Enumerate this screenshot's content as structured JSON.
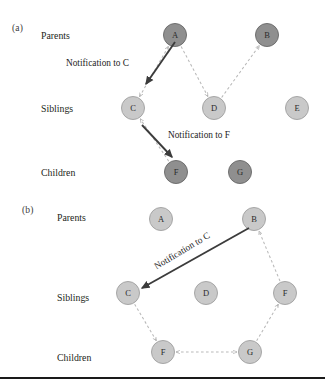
{
  "figure": {
    "background": "#ffffff",
    "rule_color": "#1a1a1a",
    "rule_y": 377
  },
  "colors": {
    "node_dark_fill": "#8f8f8f",
    "node_dark_stroke": "#6f6f6f",
    "node_light_fill": "#c9c9c9",
    "node_light_stroke": "#a6a6a6",
    "dashed_edge": "#b9b9b9",
    "solid_arrow": "#3c3c3c",
    "label_text": "#231f20"
  },
  "panels": [
    {
      "tag": "(a)",
      "tag_pos": {
        "x": 12,
        "y": 23
      },
      "row_labels": [
        {
          "text": "Parents",
          "x": 41,
          "y": 30
        },
        {
          "text": "Siblings",
          "x": 41,
          "y": 103
        },
        {
          "text": "Children",
          "x": 41,
          "y": 167
        }
      ],
      "nodes": [
        {
          "id": "A",
          "label": "A",
          "x": 175,
          "y": 35,
          "shade": "dark"
        },
        {
          "id": "B",
          "label": "B",
          "x": 267,
          "y": 35,
          "shade": "dark"
        },
        {
          "id": "C",
          "label": "C",
          "x": 133,
          "y": 108,
          "shade": "light"
        },
        {
          "id": "D",
          "label": "D",
          "x": 214,
          "y": 108,
          "shade": "light"
        },
        {
          "id": "E",
          "label": "E",
          "x": 297,
          "y": 108,
          "shade": "light"
        },
        {
          "id": "F",
          "label": "F",
          "x": 176,
          "y": 172,
          "shade": "dark"
        },
        {
          "id": "G",
          "label": "G",
          "x": 240,
          "y": 172,
          "shade": "dark"
        }
      ],
      "edges": [
        {
          "from": "C",
          "to": "A",
          "style": "dashed",
          "arrow": "both"
        },
        {
          "from": "A",
          "to": "D",
          "style": "dashed",
          "arrow": "end"
        },
        {
          "from": "D",
          "to": "B",
          "style": "dashed",
          "arrow": "end"
        },
        {
          "from": "F",
          "to": "C",
          "style": "dashed",
          "arrow": "end"
        }
      ],
      "annotations": [
        {
          "text": "Notification to C",
          "text_x": 66,
          "text_y": 58,
          "rotate": 0,
          "arrow": {
            "x1": 175,
            "y1": 42,
            "x2": 146,
            "y2": 84
          }
        },
        {
          "text": "Notification to F",
          "text_x": 168,
          "text_y": 130,
          "rotate": 0,
          "arrow": {
            "x1": 142,
            "y1": 125,
            "x2": 172,
            "y2": 157
          }
        }
      ]
    },
    {
      "tag": "(b)",
      "tag_pos": {
        "x": 22,
        "y": 205
      },
      "row_labels": [
        {
          "text": "Parents",
          "x": 57,
          "y": 212
        },
        {
          "text": "Siblings",
          "x": 57,
          "y": 292
        },
        {
          "text": "Children",
          "x": 57,
          "y": 352
        }
      ],
      "nodes": [
        {
          "id": "A",
          "label": "A",
          "x": 161,
          "y": 219,
          "shade": "light"
        },
        {
          "id": "B",
          "label": "B",
          "x": 254,
          "y": 219,
          "shade": "light"
        },
        {
          "id": "C",
          "label": "C",
          "x": 128,
          "y": 293,
          "shade": "light"
        },
        {
          "id": "D",
          "label": "D",
          "x": 206,
          "y": 293,
          "shade": "light"
        },
        {
          "id": "F",
          "label": "F",
          "x": 285,
          "y": 293,
          "shade": "light"
        },
        {
          "id": "F2",
          "label": "F",
          "x": 163,
          "y": 352,
          "shade": "light"
        },
        {
          "id": "G",
          "label": "G",
          "x": 250,
          "y": 352,
          "shade": "light"
        }
      ],
      "edges": [
        {
          "from": "C",
          "to": "F2",
          "style": "dashed",
          "arrow": "end"
        },
        {
          "from": "F2",
          "to": "G",
          "style": "dashed",
          "arrow": "both"
        },
        {
          "from": "G",
          "to": "F",
          "style": "dashed",
          "arrow": "end"
        },
        {
          "from": "F",
          "to": "B",
          "style": "dashed",
          "arrow": "end"
        }
      ],
      "annotations": [
        {
          "text": "Notification to C",
          "text_x": 155,
          "text_y": 262,
          "rotate": -31,
          "arrow": {
            "x1": 249,
            "y1": 228,
            "x2": 142,
            "y2": 288
          }
        }
      ]
    }
  ]
}
